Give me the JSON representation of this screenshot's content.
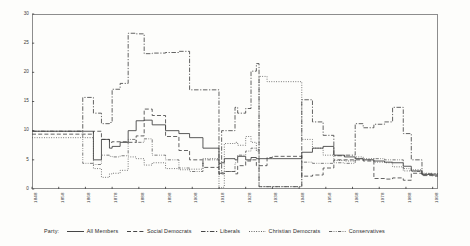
{
  "chart_data": {
    "type": "line",
    "title": "",
    "xlabel": "",
    "ylabel": "",
    "xlim": [
      1848,
      2000
    ],
    "ylim": [
      0,
      30
    ],
    "grid": false,
    "legend_position": "bottom",
    "legend_title": "Party:",
    "x_ticks": [
      "1848",
      "1858",
      "1868",
      "1878",
      "1888",
      "1898",
      "1908",
      "1918",
      "1928",
      "1938",
      "1948",
      "1958",
      "1968",
      "1978",
      "1988",
      "1998"
    ],
    "y_ticks": [
      "0",
      "5",
      "10",
      "15",
      "20",
      "25",
      "30"
    ],
    "series": [
      {
        "name": "All Members",
        "style": "solid",
        "color": "#3c3c3c",
        "x": [
          1848,
          1858,
          1867,
          1871,
          1874,
          1877,
          1878,
          1881,
          1884,
          1887,
          1890,
          1893,
          1898,
          1903,
          1907,
          1912,
          1918,
          1919,
          1920,
          1924,
          1925,
          1928,
          1930,
          1932,
          1933,
          1936,
          1938,
          1949,
          1953,
          1957,
          1961,
          1965,
          1969,
          1972,
          1976,
          1980,
          1983,
          1987,
          1990,
          1994,
          1998,
          2000
        ],
        "values": [
          9.9,
          9.9,
          9.9,
          5.0,
          8.5,
          7.0,
          7.3,
          8.0,
          10.0,
          11.7,
          11.8,
          11.0,
          10.0,
          9.5,
          8.8,
          7.0,
          4.4,
          4.5,
          5.2,
          5.0,
          5.6,
          5.0,
          5.4,
          5.2,
          5.2,
          5.2,
          5.2,
          6.3,
          7.0,
          7.3,
          5.8,
          5.5,
          5.2,
          5.0,
          4.8,
          4.6,
          4.5,
          3.9,
          3.1,
          2.5,
          2.4,
          2.4
        ]
      },
      {
        "name": "Social Democrats",
        "style": "dashed",
        "color": "#3c3c3c",
        "x": [
          1848,
          1858,
          1867,
          1871,
          1874,
          1877,
          1878,
          1881,
          1884,
          1887,
          1890,
          1893,
          1898,
          1903,
          1907,
          1912,
          1918,
          1919,
          1920,
          1924,
          1925,
          1928,
          1930,
          1932,
          1933,
          1936,
          1938,
          1949,
          1953,
          1957,
          1961,
          1965,
          1969,
          1972,
          1976,
          1980,
          1983,
          1987,
          1990,
          1994,
          1998,
          2000
        ],
        "values": [
          9.4,
          9.4,
          9.4,
          9.9,
          8.5,
          8.0,
          8.1,
          8.1,
          8.0,
          9.1,
          13.7,
          12.6,
          9.0,
          6.6,
          5.0,
          3.7,
          2.5,
          2.6,
          3.0,
          2.6,
          4.0,
          4.8,
          5.0,
          4.0,
          4.0,
          5.4,
          5.6,
          2.2,
          2.4,
          3.6,
          5.0,
          5.0,
          5.0,
          4.8,
          1.8,
          1.7,
          1.9,
          1.5,
          2.7,
          2.3,
          2.2,
          2.2
        ]
      },
      {
        "name": "Liberals",
        "style": "dashdot",
        "color": "#3c3c3c",
        "x": [
          1848,
          1858,
          1867,
          1871,
          1874,
          1877,
          1878,
          1881,
          1884,
          1887,
          1890,
          1893,
          1898,
          1903,
          1907,
          1912,
          1918,
          1919,
          1920,
          1924,
          1925,
          1928,
          1930,
          1932,
          1933,
          1936,
          1938,
          1949,
          1953,
          1957,
          1961,
          1965,
          1969,
          1972,
          1976,
          1980,
          1983,
          1987,
          1990,
          1994,
          1998,
          2000
        ],
        "values": [
          9.9,
          9.9,
          15.7,
          13.0,
          11.2,
          11.4,
          17.1,
          18.1,
          26.7,
          26.6,
          23.2,
          23.3,
          23.4,
          23.6,
          17.0,
          17.0,
          2.7,
          10.0,
          10.0,
          14.0,
          13.0,
          13.8,
          20.2,
          21.5,
          0.4,
          0.4,
          0.4,
          15.3,
          11.5,
          9.2,
          5.7,
          5.8,
          11.2,
          10.5,
          11.1,
          11.5,
          14.0,
          9.5,
          5.0,
          2.6,
          2.6,
          2.6
        ]
      },
      {
        "name": "Christian Democrats",
        "style": "dotted",
        "color": "#4a4a4a",
        "x": [
          1848,
          1858,
          1867,
          1871,
          1874,
          1877,
          1878,
          1881,
          1884,
          1887,
          1890,
          1893,
          1898,
          1903,
          1907,
          1912,
          1918,
          1919,
          1920,
          1924,
          1925,
          1928,
          1930,
          1932,
          1933,
          1936,
          1938,
          1949,
          1953,
          1957,
          1961,
          1965,
          1969,
          1972,
          1976,
          1980,
          1983,
          1987,
          1990,
          1994,
          1998,
          2000
        ],
        "values": [
          8.8,
          8.8,
          8.8,
          3.5,
          2.0,
          2.6,
          2.7,
          3.2,
          5.5,
          5.2,
          4.1,
          4.5,
          3.5,
          3.3,
          3.4,
          5.2,
          0.2,
          0.3,
          7.8,
          8.0,
          7.5,
          9.0,
          8.0,
          6.5,
          19.3,
          18.4,
          18.4,
          8.5,
          7.0,
          5.8,
          4.9,
          4.8,
          5.5,
          5.2,
          4.6,
          4.5,
          3.8,
          3.1,
          3.3,
          2.7,
          2.6,
          2.6
        ]
      },
      {
        "name": "Conservatives",
        "style": "dashdotdot",
        "color": "#5a5a5a",
        "x": [
          1848,
          1858,
          1867,
          1871,
          1874,
          1877,
          1878,
          1881,
          1884,
          1887,
          1890,
          1893,
          1898,
          1903,
          1907,
          1912,
          1918,
          1919,
          1920,
          1924,
          1925,
          1928,
          1930,
          1932,
          1933,
          1936,
          1938,
          1949,
          1953,
          1957,
          1961,
          1965,
          1969,
          1972,
          1976,
          1980,
          1983,
          1987,
          1990,
          1994,
          1998,
          2000
        ],
        "values": [
          9.9,
          9.9,
          4.4,
          4.2,
          5.8,
          5.6,
          5.5,
          5.7,
          8.5,
          8.0,
          8.6,
          5.8,
          5.0,
          3.6,
          3.0,
          5.0,
          2.7,
          2.8,
          3.0,
          4.5,
          5.8,
          6.5,
          7.0,
          6.8,
          0.4,
          0.4,
          0.4,
          4.6,
          4.4,
          4.4,
          4.5,
          4.4,
          5.2,
          5.0,
          5.2,
          5.0,
          5.0,
          3.5,
          3.0,
          2.4,
          2.4,
          2.4
        ]
      }
    ]
  },
  "legend": {
    "title": "Party:",
    "entries": [
      {
        "label": "All Members",
        "style": "solid"
      },
      {
        "label": "Social Democrats",
        "style": "dashed"
      },
      {
        "label": "Liberals",
        "style": "dashdot"
      },
      {
        "label": "Christian Democrats",
        "style": "dotted"
      },
      {
        "label": "Conservatives",
        "style": "dashdotdot"
      }
    ]
  }
}
